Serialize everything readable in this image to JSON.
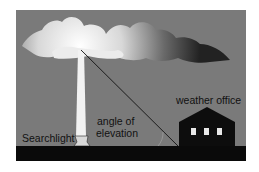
{
  "diagram": {
    "labels": {
      "searchlight": "Searchlight",
      "angle_line1": "angle of",
      "angle_line2": "elevation",
      "building": "weather office"
    },
    "colors": {
      "sky": "#7a7a7a",
      "ground": "#0a0a0a",
      "beam": "#f2f2f2",
      "building": "#0d0d0d",
      "window": "#e8e8e8"
    }
  }
}
